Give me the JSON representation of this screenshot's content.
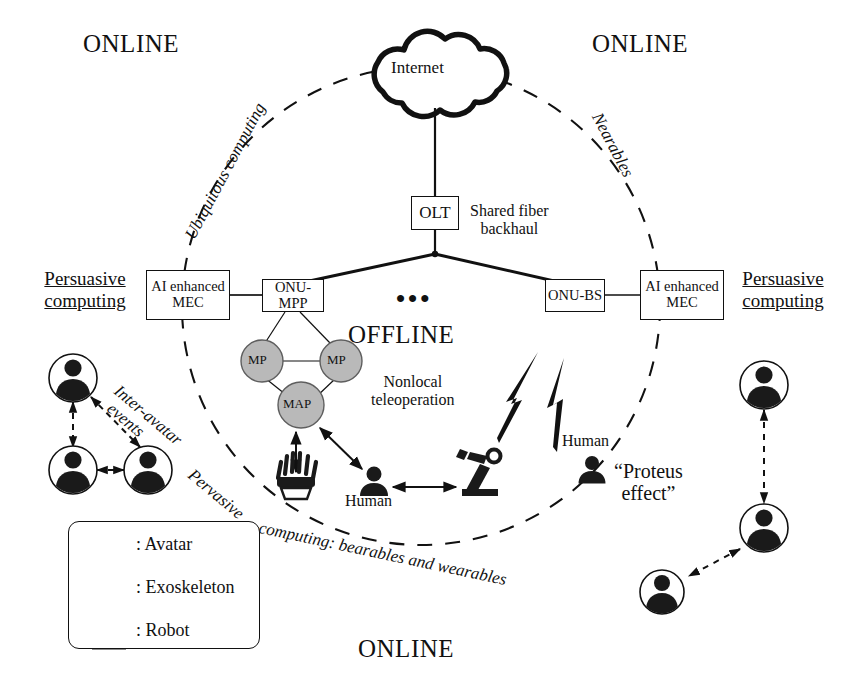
{
  "figure": {
    "background": "#ffffff",
    "ink": "#111111",
    "node_fill": "#b9b9b9"
  },
  "zones": {
    "online_top_left": "ONLINE",
    "online_top_right": "ONLINE",
    "online_bottom": "ONLINE",
    "offline_center": "OFFLINE"
  },
  "boundary_labels": {
    "upper_left": "Ubiquitous computing",
    "upper_right": "Nearables",
    "lower_left": "Pervasive",
    "lower_left2": "computing: bearables and wearables"
  },
  "side_labels": {
    "left": "Persuasive computing",
    "left_line1": "Persuasive",
    "left_line2": "computing",
    "right_line1": "Persuasive",
    "right_line2": "computing"
  },
  "network": {
    "cloud": "Internet",
    "olt": "OLT",
    "backhaul_line1": "Shared fiber",
    "backhaul_line2": "backhaul",
    "onu_mpp": "ONU-MPP",
    "onu_bs": "ONU-BS",
    "mec_left_line1": "AI enhanced",
    "mec_left_line2": "MEC",
    "mec_right_line1": "AI enhanced",
    "mec_right_line2": "MEC",
    "ellipsis": "•••",
    "mesh_nodes": [
      {
        "id": "mp1",
        "label": "MP"
      },
      {
        "id": "mp2",
        "label": "MP"
      },
      {
        "id": "map",
        "label": "MAP"
      }
    ]
  },
  "annotations": {
    "inter_avatar_line1": "Inter-avatar",
    "inter_avatar_line2": "events",
    "nonlocal_line1": "Nonlocal",
    "nonlocal_line2": "teleoperation",
    "human_center": "Human",
    "human_right": "Human",
    "proteus_line1": "“Proteus",
    "proteus_line2": "effect”"
  },
  "legend": {
    "items": [
      {
        "icon": "avatar-icon",
        "label": ": Avatar"
      },
      {
        "icon": "exoskeleton-icon",
        "label": ": Exoskeleton"
      },
      {
        "icon": "robot-icon",
        "label": ": Robot"
      }
    ]
  },
  "avatars": {
    "left_cluster": [
      {
        "id": "a1",
        "cx": 73,
        "cy": 378
      },
      {
        "id": "a2",
        "cx": 73,
        "cy": 470
      },
      {
        "id": "a3",
        "cx": 148,
        "cy": 470
      }
    ],
    "right_cluster": [
      {
        "id": "b1",
        "cx": 764,
        "cy": 385
      },
      {
        "id": "b2",
        "cx": 764,
        "cy": 528
      },
      {
        "id": "b3",
        "cx": 662,
        "cy": 592
      }
    ]
  },
  "geometry": {
    "dashed_circle": {
      "cx": 421,
      "cy": 306,
      "r": 239
    }
  }
}
